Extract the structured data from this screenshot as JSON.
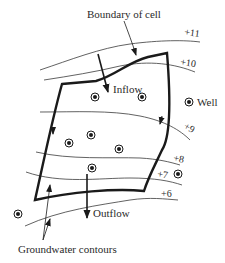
{
  "labels": {
    "boundary": "Boundary of cell",
    "inflow": "Inflow",
    "outflow": "Outflow",
    "well": "Well",
    "contours": "Groundwater contours"
  },
  "contours": [
    {
      "label": "+11",
      "value": 11
    },
    {
      "label": "+10",
      "value": 10
    },
    {
      "label": "+9",
      "value": 9
    },
    {
      "label": "+8",
      "value": 8
    },
    {
      "label": "+7",
      "value": 7
    },
    {
      "label": "+6",
      "value": 6
    }
  ],
  "colors": {
    "line": "#1a1a1a",
    "text": "#2a2a2a",
    "background": "#ffffff"
  }
}
